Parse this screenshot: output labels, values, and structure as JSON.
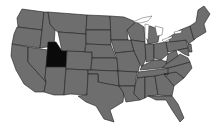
{
  "map": {
    "region": "Contiguous United States",
    "highlighted_state": "Utah",
    "colors": {
      "background": "#ffffff",
      "state_fill": "#6e6e6e",
      "highlight_fill": "#0a0a0a",
      "border": "#1e1e1e"
    }
  }
}
